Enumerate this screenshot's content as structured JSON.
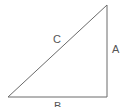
{
  "diagram": {
    "type": "right-triangle",
    "vertices": {
      "bottom_left": [
        8,
        97
      ],
      "right_angle": [
        107,
        97
      ],
      "top": [
        107,
        5
      ]
    },
    "sides": {
      "hypotenuse": {
        "label": "C"
      },
      "vertical": {
        "label": "A"
      },
      "horizontal": {
        "label": "B"
      }
    },
    "colors": {
      "line": "#6a6a6a",
      "label": "#555555",
      "background": "#ffffff"
    }
  }
}
